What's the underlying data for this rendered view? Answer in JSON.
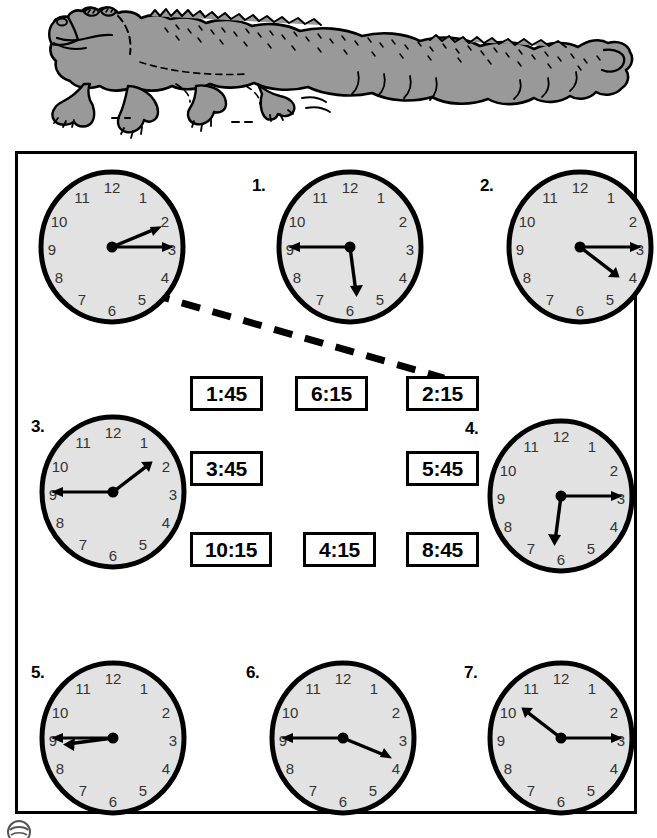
{
  "worksheet": {
    "title": "Telling Time — Quarter Hours Matching Worksheet",
    "illustration": "crocodile-illustration",
    "footer_logo": "circular-logo-mark"
  },
  "example_clock": {
    "label": "",
    "time": "2:15",
    "hour": 2,
    "minute": 15,
    "hour_angle": 67.5,
    "minute_angle": 90,
    "numerals": [
      "12",
      "1",
      "2",
      "3",
      "4",
      "5",
      "6",
      "7",
      "8",
      "9",
      "10",
      "11"
    ]
  },
  "clocks": [
    {
      "label": "1.",
      "time": "5:45",
      "hour": 5,
      "minute": 45,
      "hour_angle": 172.5,
      "minute_angle": 270
    },
    {
      "label": "2.",
      "time": "4:15",
      "hour": 4,
      "minute": 15,
      "hour_angle": 127.5,
      "minute_angle": 90
    },
    {
      "label": "3.",
      "time": "1:45",
      "hour": 1,
      "minute": 45,
      "hour_angle": 52.5,
      "minute_angle": 270
    },
    {
      "label": "4.",
      "time": "6:15",
      "hour": 6,
      "minute": 15,
      "hour_angle": 187.5,
      "minute_angle": 90
    },
    {
      "label": "5.",
      "time": "8:45",
      "hour": 8,
      "minute": 45,
      "hour_angle": 262.5,
      "minute_angle": 270
    },
    {
      "label": "6.",
      "time": "3:45",
      "hour": 3,
      "minute": 45,
      "hour_angle": 112.5,
      "minute_angle": 270
    },
    {
      "label": "7.",
      "time": "10:15",
      "hour": 10,
      "minute": 15,
      "hour_angle": 307.5,
      "minute_angle": 90
    }
  ],
  "answer_boxes": [
    {
      "value": "1:45",
      "row": 1,
      "col": 1
    },
    {
      "value": "6:15",
      "row": 1,
      "col": 2
    },
    {
      "value": "2:15",
      "row": 1,
      "col": 3
    },
    {
      "value": "3:45",
      "row": 2,
      "col": 1
    },
    {
      "value": "5:45",
      "row": 2,
      "col": 3
    },
    {
      "value": "10:15",
      "row": 3,
      "col": 1
    },
    {
      "value": "4:15",
      "row": 3,
      "col": 2
    },
    {
      "value": "8:45",
      "row": 3,
      "col": 3
    }
  ],
  "clock_numerals": [
    "12",
    "1",
    "2",
    "3",
    "4",
    "5",
    "6",
    "7",
    "8",
    "9",
    "10",
    "11"
  ],
  "colors": {
    "clock_face": "#e2e2e2",
    "clock_outline": "#000000",
    "croc_body": "#999999",
    "ink": "#000000",
    "page": "#ffffff"
  },
  "connector": {
    "from": "example-clock",
    "to": "answer-box-2-15",
    "style": "dashed"
  }
}
